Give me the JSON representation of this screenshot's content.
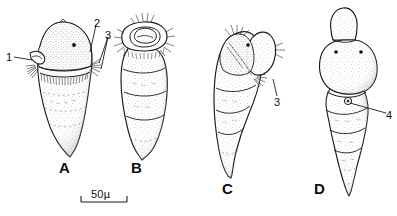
{
  "figure": {
    "kind": "scientific-illustration-plate",
    "background_color": "#ffffff",
    "ink_color": "#1a1a1a",
    "stipple_color": "#7a7a72",
    "panel_count": 4
  },
  "panels": [
    {
      "id": "A",
      "letter": "A",
      "description": "Pear-shaped larva, dorsal view, domed head with single eye spot, hooked mouthpart at left, ciliated band, pointed posterior"
    },
    {
      "id": "B",
      "letter": "B",
      "description": "Larva with everted ring-shaped oral proboscis fringed with setae, elongate segmented body, pointed posterior"
    },
    {
      "id": "C",
      "letter": "C",
      "description": "Lateral view of curved segmented larva with head flexed to the right and tufts of setae"
    },
    {
      "id": "D",
      "letter": "D",
      "description": "Ventral view of larva with retracted snout, paired eye spots, broad anterior and tapering segmented posterior"
    }
  ],
  "callouts": [
    {
      "id": "c1",
      "label": "1",
      "panel": "A",
      "note": "hooked mouthpart / stylet"
    },
    {
      "id": "c2",
      "label": "2",
      "panel": "A",
      "note": "cephalic cap surface"
    },
    {
      "id": "c3a",
      "label": "3",
      "panel": "A",
      "note": "lateral seta tuft"
    },
    {
      "id": "c3c",
      "label": "3",
      "panel": "C",
      "note": "lateral seta tuft"
    },
    {
      "id": "c4",
      "label": "4",
      "panel": "D",
      "note": "ventral pore / sucker"
    }
  ],
  "scale_bar": {
    "label": "50µ",
    "value": 50,
    "unit": "µ",
    "bar_length_px": 46
  }
}
